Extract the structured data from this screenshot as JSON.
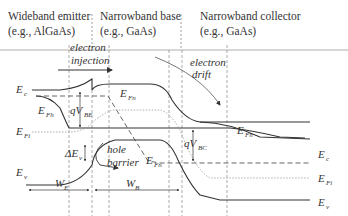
{
  "regions": [
    {
      "title": "Wideband emitter",
      "example": "(e.g., AlGaAs)"
    },
    {
      "title": "Narrowband base",
      "example": "(e.g., GaAs)"
    },
    {
      "title": "Narrowband collector",
      "example": "(e.g., GaAs)"
    }
  ],
  "annotations": {
    "electron_injection_1": "electron",
    "electron_injection_2": "injection",
    "electron_drift_1": "electron",
    "electron_drift_2": "drift",
    "hole_barrier_1": "hole",
    "hole_barrier_2": "barrier"
  },
  "band_labels": {
    "Ec_left": {
      "main": "E",
      "sub": "c"
    },
    "EFh_left": {
      "main": "E",
      "sub": "Fh"
    },
    "EFi_left": {
      "main": "E",
      "sub": "Fi"
    },
    "Ev_left": {
      "main": "E",
      "sub": "v"
    },
    "EFn_top": {
      "main": "E",
      "sub": "Fn"
    },
    "EFn_bottom": {
      "main": "E",
      "sub": "Fn"
    },
    "EFh_right": {
      "main": "E",
      "sub": "Fh"
    },
    "Ec_right": {
      "main": "E",
      "sub": "c"
    },
    "EFi_right": {
      "main": "E",
      "sub": "Fi"
    },
    "Ev_right": {
      "main": "E",
      "sub": "v"
    },
    "qVBE": {
      "main": "qV",
      "sub": "BE"
    },
    "qVBC": {
      "main": "qV",
      "sub": "BC"
    },
    "dEv": {
      "main": "ΔE",
      "sub": "v"
    },
    "WE": {
      "main": "W",
      "sub": "E"
    },
    "WB": {
      "main": "W",
      "sub": "B"
    }
  },
  "colors": {
    "line": "#333333",
    "dashed": "#555555",
    "dotted": "#888888",
    "divider": "#999999"
  }
}
